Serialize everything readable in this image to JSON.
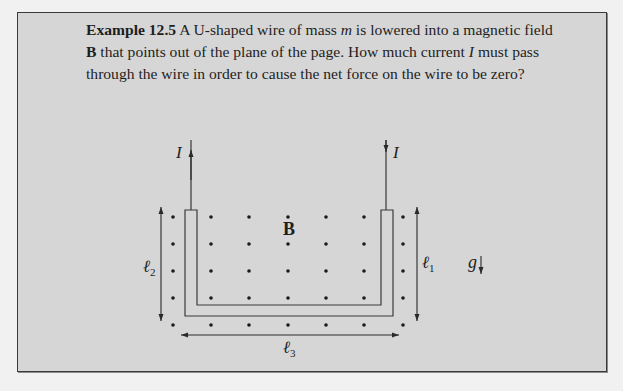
{
  "example": {
    "label": "Example 12.5",
    "text_parts": [
      {
        "t": " A U-shaped wire of mass ",
        "style": "normal"
      },
      {
        "t": "m",
        "style": "italic"
      },
      {
        "t": " is lowered into a magnetic field ",
        "style": "normal"
      },
      {
        "t": "B",
        "style": "bold"
      },
      {
        "t": " that points out of the plane of the page. How much current ",
        "style": "normal"
      },
      {
        "t": "I",
        "style": "italic"
      },
      {
        "t": " must pass through the wire in order to cause the net force on the wire to be zero?",
        "style": "normal"
      }
    ],
    "text_1": " A U-shaped wire of mass ",
    "var_m": "m",
    "text_2": " is lowered into a magnetic field ",
    "var_B": "B",
    "text_3": " that points out of the plane of the page. How much current ",
    "var_I": "I",
    "text_4": " must pass through the wire in order to cause the net force on the wire to be zero?"
  },
  "diagram": {
    "current_label_left": "I",
    "current_label_right": "I",
    "field_label": "B",
    "length_left": {
      "symbol": "ℓ",
      "subscript": "2"
    },
    "length_right": {
      "symbol": "ℓ",
      "subscript": "1"
    },
    "length_bottom": {
      "symbol": "ℓ",
      "subscript": "3"
    },
    "gravity_label": "g",
    "field_dot_columns_x": [
      173,
      211,
      249,
      288,
      326,
      364,
      403
    ],
    "field_dot_rows_y": [
      217,
      244,
      271,
      298,
      325
    ]
  }
}
